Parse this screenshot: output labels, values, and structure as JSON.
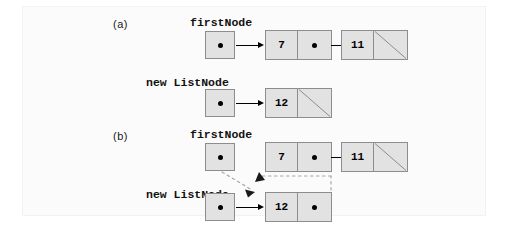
{
  "figure": {
    "background_color": "#ffffff",
    "panel_color": "#fbfbfb",
    "node_fill": "#e2e2e2",
    "node_border": "#8d8d8d",
    "line_color": "#000000",
    "dashed_color": "#b3b3b3"
  },
  "parts": [
    {
      "id": "a",
      "label": "(a)"
    },
    {
      "id": "b",
      "label": "(b)"
    }
  ],
  "labels": {
    "first_node": "firstNode",
    "new_list_node_kw": "new",
    "new_list_node_type": "ListNode",
    "new_list_node_full": "new ListNode"
  },
  "rows": [
    {
      "id": "a-first",
      "part": "a",
      "pointer_label": "firstNode",
      "pointer_cell": {
        "value": "dot",
        "points_to": "node-7-a"
      },
      "nodes": [
        {
          "id": "node-7-a",
          "data": "7",
          "link": "pointer",
          "next": "node-11-a"
        },
        {
          "id": "node-11-a",
          "data": "11",
          "link": "null"
        }
      ]
    },
    {
      "id": "a-new",
      "part": "a",
      "pointer_label": "new ListNode",
      "pointer_cell": {
        "value": "dot",
        "points_to": "node-12-a"
      },
      "nodes": [
        {
          "id": "node-12-a",
          "data": "12",
          "link": "null"
        }
      ]
    },
    {
      "id": "b-first",
      "part": "b",
      "pointer_label": "firstNode",
      "pointer_cell": {
        "value": "dot",
        "points_to": "node-12-b"
      },
      "nodes": [
        {
          "id": "node-7-b",
          "data": "7",
          "link": "pointer",
          "next": "node-11-b"
        },
        {
          "id": "node-11-b",
          "data": "11",
          "link": "null"
        }
      ]
    },
    {
      "id": "b-new",
      "part": "b",
      "pointer_label": "new ListNode",
      "pointer_cell": {
        "value": "dot",
        "points_to": "node-12-b"
      },
      "nodes": [
        {
          "id": "node-12-b",
          "data": "12",
          "link": "pointer",
          "next": "node-7-b"
        }
      ]
    }
  ],
  "node_values": {
    "seven": "7",
    "eleven": "11",
    "twelve": "12"
  },
  "connections": {
    "a_first_to_7": "solid",
    "a_7_to_11": "solid",
    "a_new_to_12": "solid",
    "b_new_to_12": "solid",
    "b_7_to_11": "solid",
    "b_firstnode_to_12": "dashed",
    "b_12_next_to_7": "dashed"
  }
}
